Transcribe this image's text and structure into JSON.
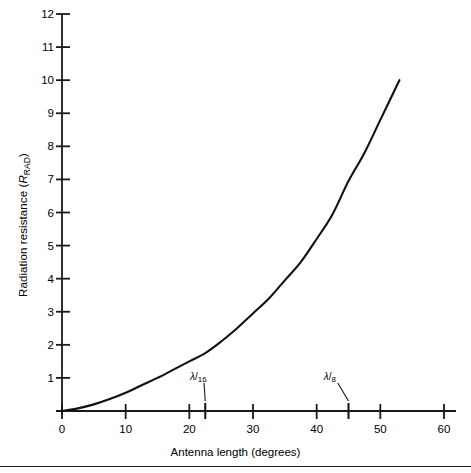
{
  "chart_data": {
    "type": "line",
    "title": "",
    "xlabel": "Antenna  length (degrees)",
    "ylabel_main": "Radiation resistance (",
    "ylabel_symbol": "R",
    "ylabel_sub": "RAD",
    "ylabel_close": ")",
    "ylabel_plain": "Radiation resistance (RRAD)",
    "xlim": [
      0,
      60
    ],
    "ylim": [
      0,
      12
    ],
    "grid": false,
    "legend": "none",
    "xticks": [
      0,
      10,
      20,
      30,
      40,
      50,
      60
    ],
    "xtick_labels": [
      "0",
      "10",
      "20",
      "30",
      "40",
      "50",
      "60"
    ],
    "yticks": [
      1,
      2,
      3,
      4,
      5,
      6,
      7,
      8,
      9,
      10,
      11,
      12
    ],
    "ytick_labels": [
      "1",
      "2",
      "3",
      "4",
      "5",
      "6",
      "7",
      "8",
      "9",
      "10",
      "11",
      "12"
    ],
    "series": [
      {
        "name": "Radiation resistance",
        "x": [
          0,
          2.5,
          5,
          7.5,
          10,
          12.5,
          15,
          17.5,
          20,
          22.5,
          25,
          27.5,
          30,
          32.5,
          35,
          37.5,
          40,
          42.5,
          45,
          47.5,
          50,
          53
        ],
        "values": [
          0.0,
          0.08,
          0.2,
          0.36,
          0.55,
          0.78,
          1.0,
          1.25,
          1.5,
          1.75,
          2.1,
          2.5,
          2.95,
          3.4,
          3.95,
          4.5,
          5.2,
          5.95,
          6.95,
          7.8,
          8.8,
          10.0
        ]
      }
    ],
    "annotations": [
      {
        "label_num": "λ",
        "label_den": "16",
        "label_plain": "λ/16",
        "x": 22.5,
        "y": 0,
        "text_x": 22.0,
        "text_y": 1.0
      },
      {
        "label_num": "λ",
        "label_den": "8",
        "label_plain": "λ/8",
        "x": 45.0,
        "y": 0,
        "text_x": 43.0,
        "text_y": 1.0
      }
    ],
    "extra_ticks_x": [
      22.5,
      45.0
    ],
    "colors": {
      "curve": "#111111",
      "axis": "#1a1a1a",
      "text": "#000000",
      "background": "#ffffff"
    }
  }
}
